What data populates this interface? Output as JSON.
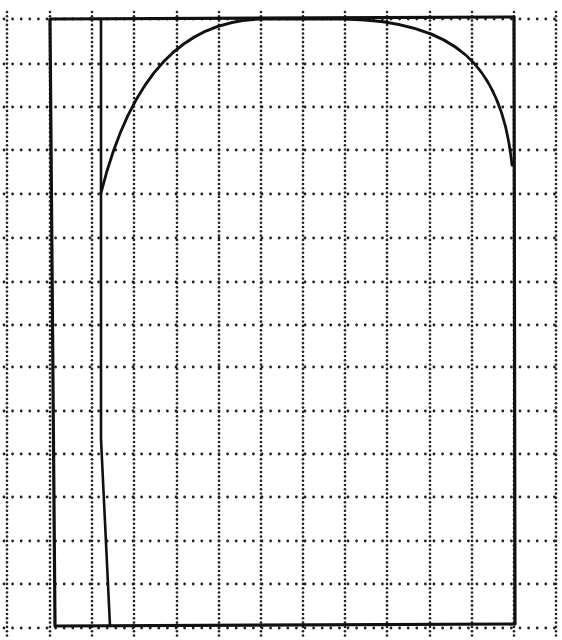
{
  "diagram": {
    "type": "pattern-template",
    "colors": {
      "background": "#ffffff",
      "ink": "#111111",
      "grid": "#222222"
    },
    "grid": {
      "x_lines": [
        7,
        50,
        92,
        134,
        177,
        219,
        261,
        303,
        345,
        387,
        430,
        472,
        514,
        556
      ],
      "y_lines": [
        19,
        64,
        107,
        150,
        194,
        238,
        282,
        325,
        367,
        411,
        454,
        497,
        541,
        584,
        628
      ]
    },
    "outer_rectangle": {
      "x1": 50,
      "y1": 19,
      "x2": 514,
      "y2": 626
    },
    "inner_line": {
      "x1": 101,
      "y1": 19,
      "x2": 110,
      "y2": 626
    },
    "arch": {
      "start": [
        101,
        193
      ],
      "peak": [
        305,
        19
      ],
      "end": [
        512,
        165
      ]
    }
  }
}
